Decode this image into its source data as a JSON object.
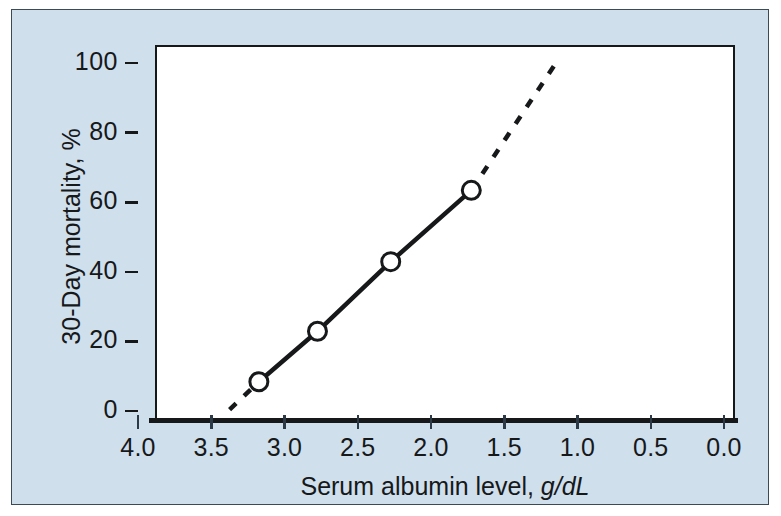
{
  "chart_data": {
    "type": "line",
    "title": "",
    "xlabel": "Serum albumin level, g/dL",
    "xlabel_main": "Serum albumin level, ",
    "xlabel_unit": "g/dL",
    "ylabel": "30-Day mortality, %",
    "xlim": [
      4.0,
      0.0
    ],
    "ylim": [
      0,
      105
    ],
    "x_axis_reversed": true,
    "grid": false,
    "legend": null,
    "xticks": [
      "4.0",
      "3.5",
      "3.0",
      "2.5",
      "2.0",
      "1.5",
      "1.0",
      "0.5",
      "0.0"
    ],
    "xtick_values": [
      4.0,
      3.5,
      3.0,
      2.5,
      2.0,
      1.5,
      1.0,
      0.5,
      0.0
    ],
    "yticks": [
      "0",
      "20",
      "40",
      "60",
      "80",
      "100"
    ],
    "ytick_values": [
      0,
      20,
      40,
      60,
      80,
      100
    ],
    "x": [
      3.25,
      2.85,
      2.35,
      1.8
    ],
    "values": [
      11,
      25.5,
      45.5,
      66
    ],
    "series": [
      {
        "name": "30-Day mortality",
        "style": "solid-with-open-circle-markers",
        "marker": "open-circle",
        "points": [
          {
            "x": 3.25,
            "y": 11
          },
          {
            "x": 2.85,
            "y": 25.5
          },
          {
            "x": 2.35,
            "y": 45.5
          },
          {
            "x": 1.8,
            "y": 66
          }
        ]
      },
      {
        "name": "extrapolation",
        "style": "dashed",
        "marker": "none",
        "points": [
          {
            "x": 3.45,
            "y": 3
          },
          {
            "x": 3.25,
            "y": 11
          },
          {
            "x": 1.8,
            "y": 66
          },
          {
            "x": 1.2,
            "y": 104
          }
        ]
      }
    ],
    "colors": {
      "panel_background": "#cfdfec",
      "plot_background": "#ffffff",
      "line": "#16181a",
      "marker_fill": "#ffffff",
      "marker_stroke": "#16181a",
      "axis": "#16181a",
      "text": "#16181a",
      "panel_border": "#3b4a55"
    },
    "annotations": [
      "Solid segment connects the four observed data points; dashed segments extrapolate the trend at both ends."
    ]
  }
}
